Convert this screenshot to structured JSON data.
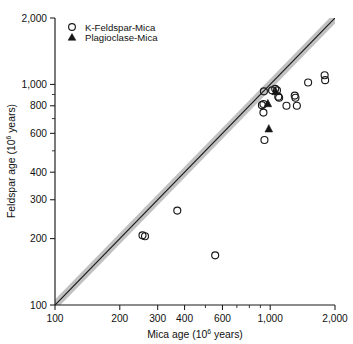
{
  "chart_data": {
    "type": "scatter",
    "title": "",
    "xlabel": "Mica age (10⁶ years)",
    "ylabel": "Feldspar age (10⁶ years)",
    "xlabel_main": "Mica age (10",
    "xlabel_sup": "6",
    "xlabel_tail": " years)",
    "ylabel_main": "Feldspar age (10",
    "ylabel_sup": "6",
    "ylabel_tail": " years)",
    "xscale": "log",
    "yscale": "log",
    "xlim": [
      100,
      2000
    ],
    "ylim": [
      100,
      2000
    ],
    "grid": false,
    "legend_position": "top-left",
    "xticks": [
      100,
      200,
      300,
      400,
      600,
      1000,
      2000
    ],
    "xtick_labels": [
      "100",
      "200",
      "300",
      "400",
      "600",
      "1,000",
      "2,000"
    ],
    "yticks": [
      100,
      200,
      300,
      400,
      600,
      800,
      1000,
      2000
    ],
    "ytick_labels": [
      "100",
      "200",
      "300",
      "400",
      "600",
      "800",
      "1,000",
      "2,000"
    ],
    "reference_line": {
      "label": "1:1 line",
      "from": [
        100,
        100
      ],
      "to": [
        2000,
        2000
      ],
      "band_width_percent": 6,
      "band_color": "#bcbcbc",
      "line_color": "#1a1a1a"
    },
    "series": [
      {
        "name": "K-Feldspar-Mica",
        "marker": "open-circle",
        "color": "#1a1a1a",
        "points": [
          [
            255,
            207
          ],
          [
            262,
            205
          ],
          [
            370,
            268
          ],
          [
            555,
            168
          ],
          [
            940,
            560
          ],
          [
            930,
            745
          ],
          [
            915,
            805
          ],
          [
            930,
            815
          ],
          [
            935,
            930
          ],
          [
            1020,
            940
          ],
          [
            1055,
            955
          ],
          [
            1075,
            940
          ],
          [
            1090,
            880
          ],
          [
            1100,
            870
          ],
          [
            1190,
            800
          ],
          [
            1300,
            890
          ],
          [
            1310,
            870
          ],
          [
            1330,
            800
          ],
          [
            1500,
            1020
          ],
          [
            1790,
            1100
          ],
          [
            1800,
            1045
          ]
        ]
      },
      {
        "name": "Plagioclase-Mica",
        "marker": "filled-triangle",
        "color": "#151515",
        "points": [
          [
            975,
            820
          ],
          [
            1060,
            930
          ],
          [
            985,
            630
          ]
        ]
      }
    ]
  },
  "legend": {
    "entries": [
      {
        "label": "K-Feldspar-Mica",
        "marker": "open-circle"
      },
      {
        "label": "Plagioclase-Mica",
        "marker": "filled-triangle"
      }
    ]
  }
}
